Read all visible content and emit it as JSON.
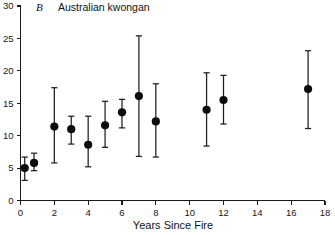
{
  "figure": {
    "panel_letter": "B",
    "panel_title": "Australian kwongan"
  },
  "chart_data": {
    "type": "scatter",
    "title": "Australian kwongan",
    "panel_label": "B",
    "xlabel": "Years Since Fire",
    "ylabel": "",
    "xlim": [
      0,
      18
    ],
    "ylim": [
      0,
      30
    ],
    "xticks": [
      0,
      2,
      4,
      6,
      8,
      10,
      12,
      14,
      16,
      18
    ],
    "xtick_labels": [
      "0",
      "2",
      "4",
      "6",
      "8",
      "10",
      "12",
      "14",
      "16",
      "18"
    ],
    "yticks": [
      0,
      5,
      10,
      15,
      20,
      25,
      30
    ],
    "ytick_labels": [
      "0",
      "5",
      "10",
      "15",
      "20",
      "25",
      "30"
    ],
    "grid": false,
    "legend": null,
    "marker": "filled-circle",
    "error_bars": "vertical-with-caps",
    "x": [
      0.25,
      0.8,
      2.0,
      3.0,
      4.0,
      5.0,
      6.0,
      7.0,
      8.0,
      11.0,
      12.0,
      17.0
    ],
    "y": [
      5.0,
      5.8,
      11.4,
      11.0,
      8.6,
      11.6,
      13.6,
      16.1,
      12.2,
      14.0,
      15.5,
      17.2
    ],
    "y_lower": [
      3.1,
      4.6,
      5.8,
      8.7,
      5.2,
      8.2,
      11.2,
      6.8,
      6.7,
      8.4,
      11.8,
      11.1
    ],
    "y_upper": [
      6.7,
      7.3,
      17.4,
      13.0,
      13.0,
      15.3,
      15.6,
      25.4,
      18.0,
      19.7,
      19.3,
      23.1
    ],
    "points": [
      {
        "x": 0.25,
        "y": 5.0,
        "lower": 3.1,
        "upper": 6.7
      },
      {
        "x": 0.8,
        "y": 5.8,
        "lower": 4.6,
        "upper": 7.3
      },
      {
        "x": 2.0,
        "y": 11.4,
        "lower": 5.8,
        "upper": 17.4
      },
      {
        "x": 3.0,
        "y": 11.0,
        "lower": 8.7,
        "upper": 13.0
      },
      {
        "x": 4.0,
        "y": 8.6,
        "lower": 5.2,
        "upper": 13.0
      },
      {
        "x": 5.0,
        "y": 11.6,
        "lower": 8.2,
        "upper": 15.3
      },
      {
        "x": 6.0,
        "y": 13.6,
        "lower": 11.2,
        "upper": 15.6
      },
      {
        "x": 7.0,
        "y": 16.1,
        "lower": 6.8,
        "upper": 25.4
      },
      {
        "x": 8.0,
        "y": 12.2,
        "lower": 6.7,
        "upper": 18.0
      },
      {
        "x": 11.0,
        "y": 14.0,
        "lower": 8.4,
        "upper": 19.7
      },
      {
        "x": 12.0,
        "y": 15.5,
        "lower": 11.8,
        "upper": 19.3
      },
      {
        "x": 17.0,
        "y": 17.2,
        "lower": 11.1,
        "upper": 23.1
      }
    ]
  },
  "colors": {
    "marker": "#0d0d0d",
    "error_bar": "#1f1f1f",
    "axis": "#1a1a1a",
    "text": "#111111",
    "background": "#ffffff"
  }
}
